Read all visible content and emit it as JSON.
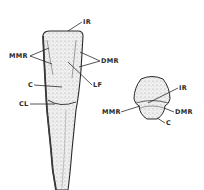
{
  "figure": {
    "type": "dental-anatomy-line-drawing",
    "views": [
      {
        "name": "labial-view",
        "labels": [
          {
            "id": "ir",
            "text": "IR",
            "x": 83,
            "y": 19
          },
          {
            "id": "mmr",
            "text": "MMR",
            "x": 9,
            "y": 53
          },
          {
            "id": "dmr",
            "text": "DMR",
            "x": 101,
            "y": 58
          },
          {
            "id": "lf",
            "text": "LF",
            "x": 93,
            "y": 82
          },
          {
            "id": "c",
            "text": "C",
            "x": 28,
            "y": 82
          },
          {
            "id": "cl",
            "text": "CL",
            "x": 19,
            "y": 101
          }
        ]
      },
      {
        "name": "incisal-view",
        "labels": [
          {
            "id": "ir",
            "text": "IR",
            "x": 179,
            "y": 85
          },
          {
            "id": "mmr",
            "text": "MMR",
            "x": 102,
            "y": 109
          },
          {
            "id": "dmr",
            "text": "DMR",
            "x": 175,
            "y": 109
          },
          {
            "id": "c",
            "text": "C",
            "x": 166,
            "y": 120
          }
        ]
      }
    ],
    "colors": {
      "ink": "#2a2a2a",
      "stipple": "#9a9a9a",
      "background": "#ffffff"
    }
  }
}
